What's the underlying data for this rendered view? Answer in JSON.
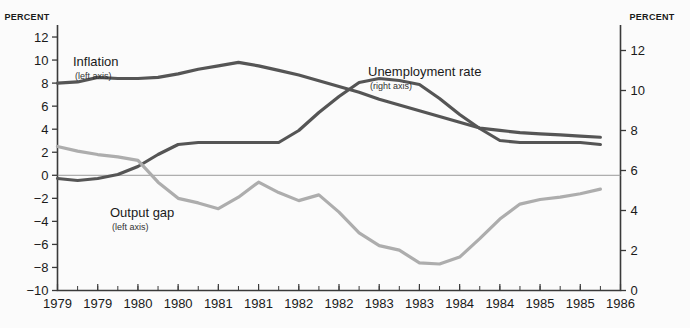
{
  "chart_data": {
    "type": "line",
    "title": "",
    "xlabel": "",
    "ylabel": "PERCENT",
    "left_axis_title": "PERCENT",
    "right_axis_title": "PERCENT",
    "left_ticks": [
      12,
      10,
      8,
      6,
      4,
      2,
      0,
      -2,
      -4,
      -6,
      -8,
      -10
    ],
    "right_ticks": [
      12,
      10,
      8,
      6,
      4,
      2,
      0
    ],
    "left_ylim": [
      -10,
      13
    ],
    "right_ylim": [
      0,
      13.25
    ],
    "xlim": [
      1979.0,
      1986.0
    ],
    "x_tick_labels": [
      "1979",
      "1979",
      "1980",
      "1980",
      "1981",
      "1981",
      "1982",
      "1982",
      "1983",
      "1983",
      "1984",
      "1984",
      "1985",
      "1985",
      "1986"
    ],
    "x_tick_values": [
      1979.0,
      1979.5,
      1980.0,
      1980.5,
      1981.0,
      1981.5,
      1982.0,
      1982.5,
      1983.0,
      1983.5,
      1984.0,
      1984.5,
      1985.0,
      1985.5,
      1986.0
    ],
    "x_minor_tick_step": 0.25,
    "grid": false,
    "zero_line": 0,
    "legend_position": "inline-annotations",
    "colors": {
      "inflation": "#555555",
      "unemployment": "#555555",
      "output_gap": "#adadad",
      "axis": "#3a3a3a",
      "zero_line": "#9a9a9a",
      "background": "#fbfbfb",
      "text": "#1a1a1a"
    },
    "series": [
      {
        "name": "Inflation",
        "sublabel": "(left axis)",
        "axis": "left",
        "color": "#555555",
        "x": [
          1979.0,
          1979.25,
          1979.5,
          1979.75,
          1980.0,
          1980.25,
          1980.5,
          1980.75,
          1981.0,
          1981.25,
          1981.5,
          1981.75,
          1982.0,
          1982.25,
          1982.5,
          1982.75,
          1983.0,
          1983.25,
          1983.5,
          1983.75,
          1984.0,
          1984.25,
          1984.5,
          1984.75,
          1985.0,
          1985.25,
          1985.5,
          1985.75
        ],
        "y": [
          8.0,
          8.1,
          8.5,
          8.4,
          8.4,
          8.5,
          8.8,
          9.2,
          9.5,
          9.8,
          9.5,
          9.1,
          8.7,
          8.2,
          7.7,
          7.2,
          6.6,
          6.1,
          5.6,
          5.1,
          4.6,
          4.1,
          3.9,
          3.7,
          3.6,
          3.5,
          3.4,
          3.3
        ]
      },
      {
        "name": "Unemployment rate",
        "sublabel": "(right axis)",
        "axis": "right",
        "color": "#555555",
        "x": [
          1979.0,
          1979.25,
          1979.5,
          1979.75,
          1980.0,
          1980.25,
          1980.5,
          1980.75,
          1981.0,
          1981.25,
          1981.5,
          1981.75,
          1982.0,
          1982.25,
          1982.5,
          1982.75,
          1983.0,
          1983.25,
          1983.5,
          1983.75,
          1984.0,
          1984.25,
          1984.5,
          1984.75,
          1985.0,
          1985.25,
          1985.5,
          1985.75
        ],
        "y": [
          5.6,
          5.5,
          5.6,
          5.8,
          6.2,
          6.8,
          7.3,
          7.4,
          7.4,
          7.4,
          7.4,
          7.4,
          8.0,
          8.9,
          9.7,
          10.4,
          10.6,
          10.5,
          10.3,
          9.6,
          8.8,
          8.1,
          7.5,
          7.4,
          7.4,
          7.4,
          7.4,
          7.3
        ]
      },
      {
        "name": "Output gap",
        "sublabel": "(left axis)",
        "axis": "left",
        "color": "#adadad",
        "x": [
          1979.0,
          1979.25,
          1979.5,
          1979.75,
          1980.0,
          1980.25,
          1980.5,
          1980.75,
          1981.0,
          1981.25,
          1981.5,
          1981.75,
          1982.0,
          1982.25,
          1982.5,
          1982.75,
          1983.0,
          1983.25,
          1983.5,
          1983.75,
          1984.0,
          1984.25,
          1984.5,
          1984.75,
          1985.0,
          1985.25,
          1985.5,
          1985.75
        ],
        "y": [
          2.5,
          2.1,
          1.8,
          1.6,
          1.3,
          -0.6,
          -2.0,
          -2.4,
          -2.9,
          -1.9,
          -0.6,
          -1.5,
          -2.2,
          -1.7,
          -3.2,
          -5.0,
          -6.1,
          -6.5,
          -7.6,
          -7.7,
          -7.1,
          -5.5,
          -3.8,
          -2.5,
          -2.1,
          -1.9,
          -1.6,
          -1.2
        ]
      }
    ],
    "annotations": [
      {
        "name": "inflation-label",
        "text": "Inflation",
        "sub": "(left axis)",
        "x": 73,
        "y": 66
      },
      {
        "name": "unemployment-label",
        "text": "Unemployment rate",
        "sub": "(right axis)",
        "x": 368,
        "y": 76
      },
      {
        "name": "output-gap-label",
        "text": "Output gap",
        "sub": "(left axis)",
        "x": 110,
        "y": 217
      }
    ]
  }
}
